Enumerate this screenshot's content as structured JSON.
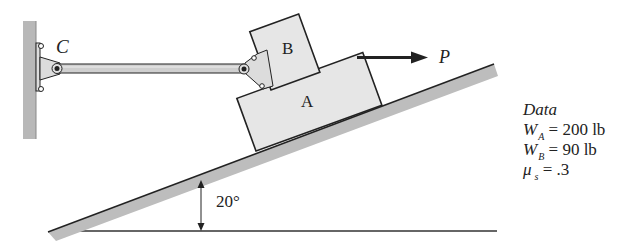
{
  "figure": {
    "labels": {
      "pin": "C",
      "block_top": "B",
      "block_bottom": "A",
      "force": "P",
      "angle": "20°"
    },
    "angle_deg": 20,
    "colors": {
      "block_fill": "#e6e6e6",
      "incline_fill": "#bdbdbd",
      "wall_fill": "#b8b8b8",
      "outline": "#222222",
      "rod_fill": "#cfcfcf"
    }
  },
  "data_panel": {
    "title": "Data",
    "rows": [
      {
        "symbol": "W",
        "subscript": "A",
        "equals": "=",
        "value": "200 lb"
      },
      {
        "symbol": "W",
        "subscript": "B",
        "equals": "=",
        "value": "90 lb"
      },
      {
        "symbol": "μ",
        "subscript": "s",
        "equals": "=",
        "value": ".3"
      }
    ]
  }
}
